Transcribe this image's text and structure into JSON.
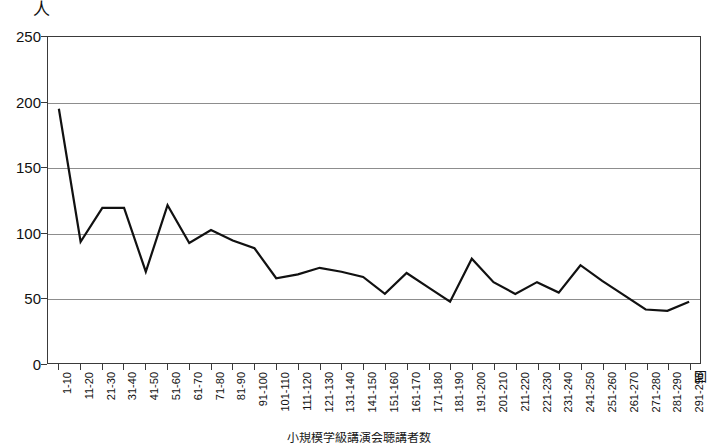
{
  "chart_data": {
    "type": "line",
    "title": "",
    "subtitle": "",
    "xlabel": "回",
    "ylabel": "人",
    "ylim": [
      0,
      250
    ],
    "ytick_labels": [
      "250",
      "200",
      "150",
      "100",
      "50",
      "0"
    ],
    "ytick_values": [
      250,
      200,
      150,
      100,
      50,
      0
    ],
    "grid": true,
    "legend": false,
    "legend_position": "none",
    "line_color": "#111111",
    "categories": [
      "1-10",
      "11-20",
      "21-30",
      "31-40",
      "41-50",
      "51-60",
      "61-70",
      "71-80",
      "81-90",
      "91-100",
      "101-110",
      "111-120",
      "121-130",
      "131-140",
      "141-150",
      "151-160",
      "161-170",
      "171-180",
      "181-190",
      "191-200",
      "201-210",
      "211-220",
      "221-230",
      "231-240",
      "241-250",
      "251-260",
      "261-270",
      "271-280",
      "281-290",
      "291-298"
    ],
    "values": [
      195,
      93,
      119,
      119,
      70,
      121,
      92,
      102,
      94,
      88,
      65,
      68,
      73,
      70,
      66,
      53,
      69,
      58,
      47,
      80,
      62,
      53,
      62,
      54,
      75,
      63,
      52,
      41,
      40,
      47
    ]
  },
  "axes": {
    "y_unit_label": "人",
    "x_unit_label": "回"
  },
  "caption": {
    "text": "小規模学級講演会聴講者数"
  }
}
